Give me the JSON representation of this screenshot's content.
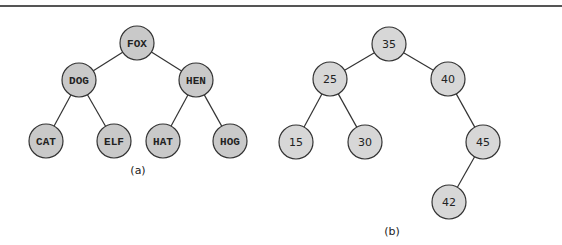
{
  "figure": {
    "trees": [
      {
        "id": "a",
        "caption": "(a)",
        "caption_pos": [
          138,
          170
        ],
        "fill": "#c9c9c9",
        "font": "mono",
        "nodes": [
          {
            "label": "FOX",
            "x": 137,
            "y": 43
          },
          {
            "label": "DOG",
            "x": 79,
            "y": 80
          },
          {
            "label": "HEN",
            "x": 196,
            "y": 80
          },
          {
            "label": "CAT",
            "x": 46,
            "y": 141
          },
          {
            "label": "ELF",
            "x": 114,
            "y": 141
          },
          {
            "label": "HAT",
            "x": 163,
            "y": 141
          },
          {
            "label": "HOG",
            "x": 230,
            "y": 141
          }
        ],
        "edges": [
          [
            0,
            1
          ],
          [
            0,
            2
          ],
          [
            1,
            3
          ],
          [
            1,
            4
          ],
          [
            2,
            5
          ],
          [
            2,
            6
          ]
        ]
      },
      {
        "id": "b",
        "caption": "(b)",
        "caption_pos": [
          392,
          231
        ],
        "fill": "#d7d7d7",
        "font": "sans",
        "nodes": [
          {
            "label": "35",
            "x": 389,
            "y": 44
          },
          {
            "label": "25",
            "x": 330,
            "y": 79
          },
          {
            "label": "40",
            "x": 448,
            "y": 79
          },
          {
            "label": "15",
            "x": 296,
            "y": 142
          },
          {
            "label": "30",
            "x": 365,
            "y": 142
          },
          {
            "label": "45",
            "x": 483,
            "y": 142
          },
          {
            "label": "42",
            "x": 449,
            "y": 202
          }
        ],
        "edges": [
          [
            0,
            1
          ],
          [
            0,
            2
          ],
          [
            1,
            3
          ],
          [
            1,
            4
          ],
          [
            2,
            5
          ],
          [
            5,
            6
          ]
        ]
      }
    ],
    "node_radius": 17,
    "stroke": "#333333"
  }
}
